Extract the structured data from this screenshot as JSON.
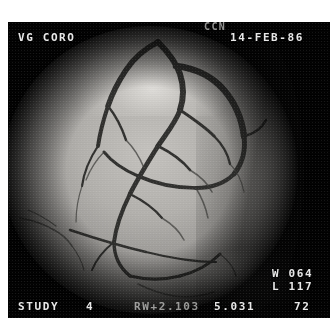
{
  "overlay": {
    "study_label": "VG CORO",
    "operator_code": "CCN",
    "date": "14-FEB-86",
    "window_label": "W",
    "window_value": "064",
    "level_label": "L",
    "level_value": "117",
    "study_word": "STUDY",
    "study_number": "4",
    "rotation_readout": "RW+2.103",
    "value_1": "5.031",
    "value_2": "72"
  },
  "modality": {
    "view_name": "coronary-angiogram",
    "field_shape": "circular-image-intensifier"
  },
  "colors": {
    "frame_background": "#050505",
    "overlay_text": "#e8e8e8",
    "field_mid_grey": "#b2b0ac",
    "vessel_dark": "#2a2a28",
    "page_background": "#ffffff"
  }
}
